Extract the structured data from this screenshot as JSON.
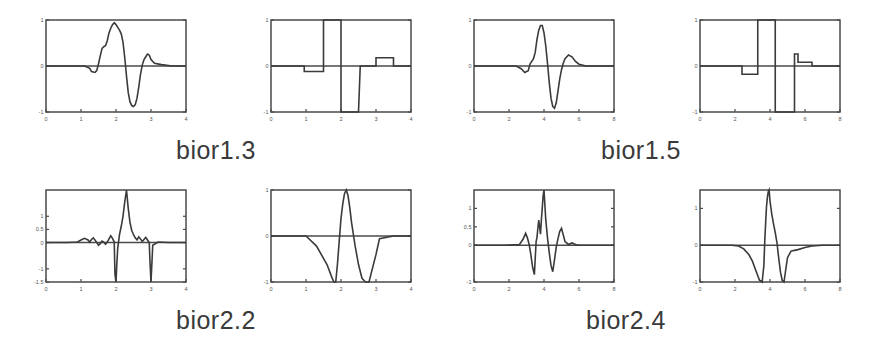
{
  "figure": {
    "type": "wavelet-family-figure",
    "background": "#ffffff",
    "line_color": "#3b3b3b",
    "axis_color": "#4a4a4a",
    "rows": 2,
    "columns": 4,
    "captions": [
      {
        "id": "bior1.3",
        "label": "bior1.3"
      },
      {
        "id": "bior1.5",
        "label": "bior1.5"
      },
      {
        "id": "bior2.2",
        "label": "bior2.2"
      },
      {
        "id": "bior2.4",
        "label": "bior2.4"
      }
    ]
  },
  "chart_data": [
    {
      "id": "bior1.3-decomposition-scaling",
      "type": "line",
      "title": "",
      "family": "bior1.3",
      "role": "decomposition scaling function phi",
      "xlabel": "",
      "ylabel": "",
      "xlim": [
        0,
        4
      ],
      "ylim": [
        -1,
        1
      ],
      "grid": false,
      "legend": "none",
      "xticks": [
        0,
        1,
        2,
        3,
        4
      ],
      "xticklabels": [
        "0",
        "1",
        "2",
        "3",
        "4"
      ],
      "yticks": [
        -1,
        0,
        1
      ],
      "yticklabels": [
        "-1",
        "0",
        "1"
      ],
      "x": [
        0.0,
        0.4,
        0.8,
        1.1,
        1.25,
        1.3,
        1.4,
        1.45,
        1.5,
        1.55,
        1.6,
        1.65,
        1.7,
        1.75,
        1.8,
        1.85,
        1.9,
        1.95,
        2.0,
        2.05,
        2.1,
        2.15,
        2.2,
        2.25,
        2.3,
        2.35,
        2.4,
        2.45,
        2.5,
        2.55,
        2.6,
        2.65,
        2.7,
        2.75,
        2.8,
        2.85,
        2.9,
        2.95,
        3.0,
        3.1,
        3.3,
        3.6,
        4.0
      ],
      "y": [
        0.0,
        0.0,
        0.0,
        0.0,
        -0.05,
        -0.12,
        -0.14,
        -0.1,
        0.05,
        0.22,
        0.38,
        0.42,
        0.44,
        0.55,
        0.72,
        0.82,
        0.9,
        0.94,
        0.9,
        0.84,
        0.78,
        0.7,
        0.52,
        0.18,
        -0.22,
        -0.58,
        -0.78,
        -0.86,
        -0.88,
        -0.84,
        -0.7,
        -0.46,
        -0.18,
        0.02,
        0.14,
        0.2,
        0.26,
        0.24,
        0.14,
        0.06,
        0.03,
        0.0,
        0.0
      ]
    },
    {
      "id": "bior1.3-decomposition-wavelet",
      "type": "line",
      "title": "",
      "family": "bior1.3",
      "role": "decomposition wavelet function psi",
      "xlabel": "",
      "ylabel": "",
      "xlim": [
        0,
        4
      ],
      "ylim": [
        -1,
        1
      ],
      "grid": false,
      "legend": "none",
      "xticks": [
        0,
        1,
        2,
        3,
        4
      ],
      "xticklabels": [
        "0",
        "1",
        "2",
        "3",
        "4"
      ],
      "yticks": [
        -1,
        0,
        1
      ],
      "yticklabels": [
        "-1",
        "0",
        "1"
      ],
      "x": [
        0.0,
        0.95,
        0.95,
        1.0,
        1.45,
        1.45,
        1.5,
        1.5,
        1.95,
        1.95,
        2.0,
        2.0,
        2.5,
        2.5,
        2.55,
        3.0,
        3.0,
        3.05,
        3.5,
        3.5,
        4.0
      ],
      "y": [
        0.0,
        0.0,
        -0.12,
        -0.12,
        -0.12,
        -0.12,
        -0.12,
        1.0,
        1.0,
        1.0,
        1.0,
        -1.0,
        -1.0,
        -1.0,
        0.0,
        0.0,
        0.18,
        0.18,
        0.18,
        0.0,
        0.0
      ]
    },
    {
      "id": "bior1.5-decomposition-scaling",
      "type": "line",
      "title": "",
      "family": "bior1.5",
      "role": "decomposition scaling function phi",
      "xlabel": "",
      "ylabel": "",
      "xlim": [
        0,
        8
      ],
      "ylim": [
        -1,
        1
      ],
      "grid": false,
      "legend": "none",
      "xticks": [
        0,
        2,
        4,
        6,
        8
      ],
      "xticklabels": [
        "0",
        "2",
        "4",
        "6",
        "8"
      ],
      "yticks": [
        -1,
        0,
        1
      ],
      "yticklabels": [
        "-1",
        "0",
        "1"
      ],
      "x": [
        0.0,
        1.5,
        2.4,
        2.7,
        2.9,
        3.1,
        3.2,
        3.3,
        3.4,
        3.5,
        3.6,
        3.7,
        3.8,
        3.9,
        4.0,
        4.1,
        4.2,
        4.3,
        4.4,
        4.5,
        4.6,
        4.7,
        4.8,
        4.9,
        5.0,
        5.1,
        5.2,
        5.4,
        5.6,
        5.8,
        6.0,
        6.4,
        7.0,
        8.0
      ],
      "y": [
        0.0,
        0.0,
        0.0,
        -0.06,
        -0.14,
        -0.1,
        0.04,
        0.1,
        0.16,
        0.3,
        0.58,
        0.78,
        0.88,
        0.88,
        0.72,
        0.44,
        0.06,
        -0.36,
        -0.7,
        -0.88,
        -0.92,
        -0.8,
        -0.54,
        -0.28,
        -0.08,
        0.06,
        0.16,
        0.24,
        0.2,
        0.1,
        0.04,
        0.0,
        0.0,
        0.0
      ]
    },
    {
      "id": "bior1.5-decomposition-wavelet",
      "type": "line",
      "title": "",
      "family": "bior1.5",
      "role": "decomposition wavelet function psi",
      "xlabel": "",
      "ylabel": "",
      "xlim": [
        0,
        8
      ],
      "ylim": [
        -1,
        1
      ],
      "grid": false,
      "legend": "none",
      "xticks": [
        0,
        2,
        4,
        6,
        8
      ],
      "xticklabels": [
        "0",
        "2",
        "4",
        "6",
        "8"
      ],
      "yticks": [
        -1,
        0,
        1
      ],
      "yticklabels": [
        "-1",
        "0",
        "1"
      ],
      "x": [
        0.0,
        2.4,
        2.4,
        3.3,
        3.3,
        3.6,
        3.6,
        4.3,
        4.3,
        4.6,
        4.6,
        5.4,
        5.4,
        5.6,
        5.6,
        6.4,
        6.4,
        8.0
      ],
      "y": [
        0.0,
        0.0,
        -0.18,
        -0.18,
        1.0,
        1.0,
        1.0,
        1.0,
        -1.0,
        -1.0,
        -1.0,
        -1.0,
        0.26,
        0.26,
        0.08,
        0.08,
        0.0,
        0.0
      ]
    },
    {
      "id": "bior2.2-decomposition-scaling",
      "type": "line",
      "title": "",
      "family": "bior2.2",
      "role": "decomposition scaling function phi",
      "xlabel": "",
      "ylabel": "",
      "xlim": [
        0,
        4
      ],
      "ylim": [
        -1.5,
        2
      ],
      "grid": false,
      "legend": "none",
      "xticks": [
        0,
        1,
        2,
        3,
        4
      ],
      "xticklabels": [
        "0",
        "1",
        "2",
        "3",
        "4"
      ],
      "yticks": [
        -1.5,
        -1,
        0,
        0.5,
        1
      ],
      "yticklabels": [
        "-1.5",
        "-1",
        "0",
        "0.5",
        "1"
      ],
      "x": [
        0.0,
        0.6,
        0.9,
        1.0,
        1.1,
        1.2,
        1.25,
        1.3,
        1.35,
        1.4,
        1.45,
        1.5,
        1.55,
        1.6,
        1.65,
        1.7,
        1.75,
        1.8,
        1.85,
        1.9,
        1.95,
        1.96,
        1.97,
        2.0,
        2.02,
        2.05,
        2.1,
        2.15,
        2.2,
        2.25,
        2.3,
        2.35,
        2.4,
        2.45,
        2.5,
        2.55,
        2.6,
        2.65,
        2.7,
        2.75,
        2.8,
        2.85,
        2.9,
        2.95,
        2.97,
        3.0,
        3.05,
        3.2,
        3.5,
        4.0
      ],
      "y": [
        0.0,
        0.0,
        0.02,
        0.1,
        0.16,
        0.1,
        0.02,
        0.12,
        0.18,
        0.1,
        0.0,
        -0.1,
        -0.04,
        0.06,
        0.02,
        -0.06,
        0.02,
        0.14,
        0.26,
        0.16,
        0.02,
        -0.6,
        -1.2,
        -1.5,
        -0.9,
        -0.2,
        0.3,
        0.62,
        1.0,
        1.55,
        2.0,
        1.3,
        0.76,
        0.46,
        0.3,
        0.18,
        0.1,
        0.22,
        0.14,
        0.04,
        0.12,
        0.2,
        0.1,
        0.0,
        -0.7,
        -1.5,
        -0.1,
        0.02,
        0.0,
        0.0
      ]
    },
    {
      "id": "bior2.2-decomposition-wavelet",
      "type": "line",
      "title": "",
      "family": "bior2.2",
      "role": "decomposition wavelet function psi",
      "xlabel": "",
      "ylabel": "",
      "xlim": [
        0,
        4
      ],
      "ylim": [
        -1,
        1
      ],
      "grid": false,
      "legend": "none",
      "xticks": [
        0,
        1,
        2,
        3,
        4
      ],
      "xticklabels": [
        "0",
        "1",
        "2",
        "3",
        "4"
      ],
      "yticks": [
        -1,
        0,
        1
      ],
      "yticklabels": [
        "-1",
        "0",
        "1"
      ],
      "x": [
        0.0,
        0.95,
        1.0,
        1.3,
        1.6,
        1.75,
        1.8,
        1.85,
        1.9,
        1.95,
        2.0,
        2.05,
        2.1,
        2.15,
        2.2,
        2.25,
        2.3,
        2.4,
        2.5,
        2.6,
        2.7,
        2.8,
        3.0,
        3.1,
        3.5,
        4.0
      ],
      "y": [
        0.0,
        0.0,
        0.0,
        -0.22,
        -0.62,
        -0.92,
        -1.0,
        -1.0,
        -0.6,
        -0.1,
        0.38,
        0.7,
        0.92,
        1.0,
        0.88,
        0.62,
        0.3,
        -0.2,
        -0.62,
        -0.92,
        -1.0,
        -1.0,
        -0.4,
        -0.06,
        0.0,
        0.0
      ]
    },
    {
      "id": "bior2.4-decomposition-scaling",
      "type": "line",
      "title": "",
      "family": "bior2.4",
      "role": "decomposition scaling function phi",
      "xlabel": "",
      "ylabel": "",
      "xlim": [
        0,
        8
      ],
      "ylim": [
        -1,
        1.5
      ],
      "grid": false,
      "legend": "none",
      "xticks": [
        0,
        2,
        4,
        6,
        8
      ],
      "xticklabels": [
        "0",
        "2",
        "4",
        "6",
        "8"
      ],
      "yticks": [
        -1,
        0,
        0.5,
        1
      ],
      "yticklabels": [
        "-1",
        "0",
        "0.5",
        "1"
      ],
      "x": [
        0.0,
        1.8,
        2.6,
        2.8,
        2.95,
        3.05,
        3.15,
        3.25,
        3.35,
        3.45,
        3.5,
        3.55,
        3.6,
        3.65,
        3.7,
        3.75,
        3.8,
        3.85,
        3.9,
        3.95,
        4.0,
        4.05,
        4.1,
        4.2,
        4.3,
        4.4,
        4.5,
        4.6,
        4.7,
        4.8,
        4.9,
        5.0,
        5.1,
        5.2,
        5.4,
        5.6,
        5.8,
        6.0,
        6.5,
        7.0,
        8.0
      ],
      "y": [
        0.0,
        0.0,
        0.02,
        0.16,
        0.32,
        0.2,
        0.02,
        -0.26,
        -0.6,
        -0.8,
        -0.35,
        0.1,
        0.22,
        0.46,
        0.68,
        0.5,
        0.3,
        0.7,
        1.0,
        1.35,
        1.5,
        1.1,
        0.7,
        0.2,
        -0.2,
        -0.55,
        -0.72,
        -0.4,
        -0.05,
        0.18,
        0.38,
        0.46,
        0.28,
        0.1,
        0.02,
        0.06,
        0.02,
        0.0,
        0.0,
        0.0,
        0.0
      ]
    },
    {
      "id": "bior2.4-decomposition-wavelet",
      "type": "line",
      "title": "",
      "family": "bior2.4",
      "role": "decomposition wavelet function psi",
      "xlabel": "",
      "ylabel": "",
      "xlim": [
        0,
        8
      ],
      "ylim": [
        -1,
        1.5
      ],
      "grid": false,
      "legend": "none",
      "xticks": [
        0,
        2,
        4,
        6,
        8
      ],
      "xticklabels": [
        "0",
        "2",
        "4",
        "6",
        "8"
      ],
      "yticks": [
        -1,
        0,
        1
      ],
      "yticklabels": [
        "-1",
        "0",
        "1"
      ],
      "x": [
        0.0,
        1.8,
        2.2,
        2.5,
        2.8,
        3.0,
        3.2,
        3.4,
        3.55,
        3.65,
        3.7,
        3.75,
        3.8,
        3.85,
        3.9,
        3.95,
        4.0,
        4.1,
        4.2,
        4.3,
        4.4,
        4.5,
        4.6,
        4.7,
        4.8,
        4.9,
        5.0,
        5.2,
        5.4,
        5.6,
        6.0,
        6.4,
        7.0,
        8.0
      ],
      "y": [
        0.0,
        0.0,
        -0.02,
        -0.1,
        -0.26,
        -0.44,
        -0.7,
        -0.95,
        -1.0,
        -0.55,
        0.1,
        0.6,
        1.05,
        1.3,
        1.45,
        1.5,
        1.2,
        0.85,
        0.58,
        0.34,
        0.06,
        -0.36,
        -0.74,
        -0.96,
        -1.0,
        -0.66,
        -0.34,
        -0.16,
        -0.14,
        -0.12,
        -0.06,
        -0.02,
        0.0,
        0.0
      ]
    }
  ]
}
